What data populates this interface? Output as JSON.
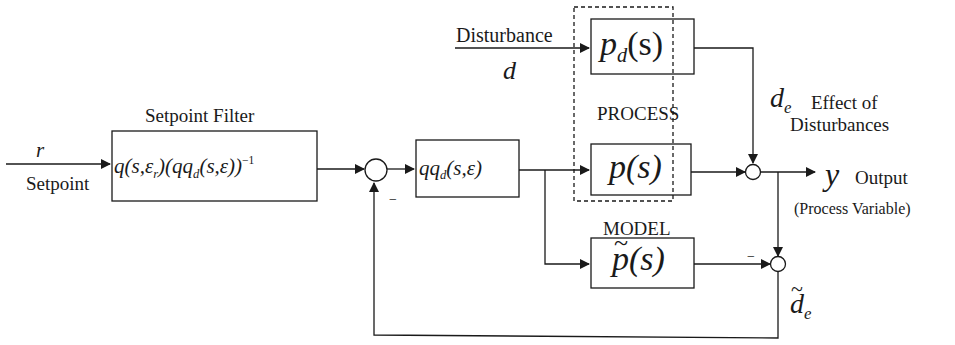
{
  "diagram": {
    "type": "internal-model-control block diagram",
    "inputs": {
      "setpoint": {
        "symbol": "r",
        "label": "Setpoint"
      },
      "disturbance": {
        "symbol": "d",
        "label": "Disturbance"
      }
    },
    "blocks": {
      "setpoint_filter": {
        "title": "Setpoint Filter",
        "expr_main": "q(s,ε",
        "expr_sub1": "r",
        "expr_mid": ")(qq",
        "expr_sub2": "d",
        "expr_tail": "(s,ε))",
        "expr_sup": "−1"
      },
      "controller": {
        "expr_main": "qq",
        "expr_sub": "d",
        "expr_tail": "(s,ε)"
      },
      "disturbance_model": {
        "expr_main": "p",
        "expr_sub": "d",
        "expr_tail": "(s)"
      },
      "process": {
        "expr": "p(s)"
      },
      "model": {
        "title": "MODEL",
        "expr_tilde": "~",
        "expr": "p(s)"
      }
    },
    "groups": {
      "process_group": {
        "title": "PROCESS"
      }
    },
    "outputs": {
      "output": {
        "symbol": "y",
        "label": "Output",
        "sublabel": "(Process Variable)"
      },
      "disturbance_effect": {
        "symbol": "d",
        "sub": "e",
        "label_line1": "Effect of",
        "label_line2": "Disturbances"
      },
      "estimated_disturbance": {
        "symbol": "d",
        "tilde": "~",
        "sub": "e"
      }
    },
    "signs": {
      "feedback_minus": "−",
      "model_minus": "−"
    }
  }
}
